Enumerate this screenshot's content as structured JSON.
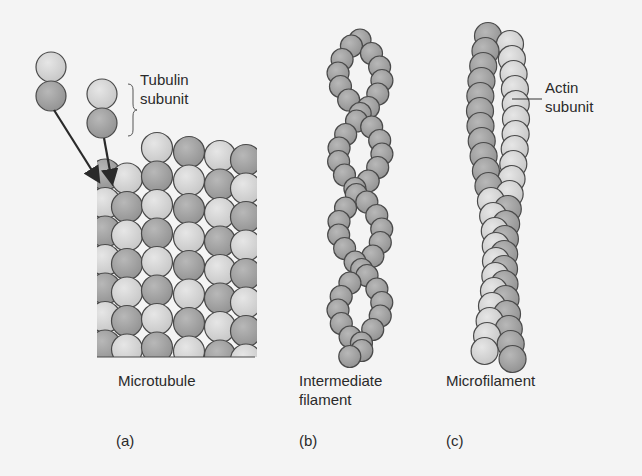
{
  "figure": {
    "panels": [
      {
        "id": "a",
        "name": "Microtubule",
        "letter": "(a)"
      },
      {
        "id": "b",
        "name_line1": "Intermediate",
        "name_line2": "filament",
        "letter": "(b)"
      },
      {
        "id": "c",
        "name": "Microfilament",
        "letter": "(c)"
      }
    ],
    "annotations": {
      "tubulin_line1": "Tubulin",
      "tubulin_line2": "subunit",
      "actin_line1": "Actin",
      "actin_line2": "subunit"
    },
    "colors": {
      "background": "#f4f4f4",
      "light_sphere": "#d6d6d6",
      "dark_sphere": "#a4a4a4",
      "outline": "#4a4a4a",
      "arrow": "#2a2a2a"
    }
  }
}
